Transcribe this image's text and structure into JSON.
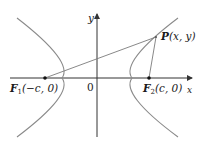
{
  "diagram": {
    "type": "hyperbola-foci",
    "colors": {
      "curve": "#8a8a8a",
      "axis": "#333333",
      "segment": "#7a7a7a",
      "point": "#111111",
      "text": "#1a1a1a"
    },
    "axes": {
      "x_label": "x",
      "y_label": "y",
      "origin_label": "0"
    },
    "points": {
      "F1": {
        "name": "F",
        "sub": "1",
        "coords": "(−c, 0)"
      },
      "F2": {
        "name": "F",
        "sub": "2",
        "coords": "(c, 0)"
      },
      "P": {
        "name": "P",
        "coords": "(x, y)"
      }
    },
    "segments": [
      "F1-P",
      "F2-P"
    ],
    "branches": [
      "left",
      "right"
    ]
  }
}
